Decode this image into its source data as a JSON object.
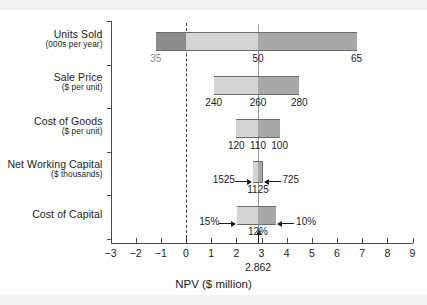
{
  "chart_data": {
    "type": "bar",
    "title": "",
    "xlabel": "NPV ($ million)",
    "ylabel": "",
    "xlim": [
      -3,
      9
    ],
    "xticks": [
      -3,
      -2,
      -1,
      0,
      1,
      2,
      3,
      4,
      5,
      6,
      7,
      8,
      9
    ],
    "xticklabels": [
      "−3",
      "−2",
      "−1",
      "0",
      "1",
      "2",
      "3",
      "4",
      "5",
      "6",
      "7",
      "8",
      "9"
    ],
    "grid": false,
    "legend": false,
    "base_case_npv": 2.862,
    "base_case_label": "2.862",
    "zero_line": 0,
    "categories": [
      {
        "name": "Units Sold",
        "label_line1": "Units Sold",
        "label_line2": "(000s per year)",
        "low_npv": -1.2,
        "high_npv": 6.78,
        "low_driver_label": "35",
        "base_driver_label": "50",
        "high_driver_label": "65",
        "low_label_muted": true,
        "labels_inside": false,
        "arrow_callouts": false
      },
      {
        "name": "Sale Price",
        "label_line1": "Sale Price",
        "label_line2": "($ per unit)",
        "low_npv": 1.1,
        "high_npv": 4.5,
        "low_driver_label": "240",
        "base_driver_label": "260",
        "high_driver_label": "280",
        "low_label_muted": false,
        "labels_inside": false,
        "arrow_callouts": false
      },
      {
        "name": "Cost of Goods",
        "label_line1": "Cost of Goods",
        "label_line2": "($ per unit)",
        "low_npv": 2.0,
        "high_npv": 3.72,
        "low_driver_label": "120",
        "base_driver_label": "110",
        "high_driver_label": "100",
        "low_label_muted": false,
        "labels_inside": false,
        "arrow_callouts": false
      },
      {
        "name": "Net Working Capital",
        "label_line1": "Net Working Capital",
        "label_line2": "($ thousands)",
        "low_npv": 2.66,
        "high_npv": 3.04,
        "low_driver_label": "1525",
        "base_driver_label": "1125",
        "high_driver_label": "725",
        "low_label_muted": false,
        "labels_inside": false,
        "arrow_callouts": true
      },
      {
        "name": "Cost of Capital",
        "label_line1": "Cost of Capital",
        "label_line2": "",
        "low_npv": 2.04,
        "high_npv": 3.58,
        "low_driver_label": "15%",
        "base_driver_label": "12%",
        "high_driver_label": "10%",
        "low_label_muted": false,
        "labels_inside": false,
        "arrow_callouts": true
      }
    ],
    "colors": {
      "segment_below_zero": "#8c8c8c",
      "segment_low_to_base": "#d4d4d4",
      "segment_base_to_high": "#a8a8a8",
      "bar_border": "#6d6d6d",
      "axis": "#4a4a4a",
      "base_case_line": "#9a9a9a",
      "zero_line": "#3a3a3a",
      "text": "#1b1b1b",
      "muted_text": "#8d8d8d",
      "band": "#f2f2f2",
      "background": "#ffffff"
    }
  }
}
